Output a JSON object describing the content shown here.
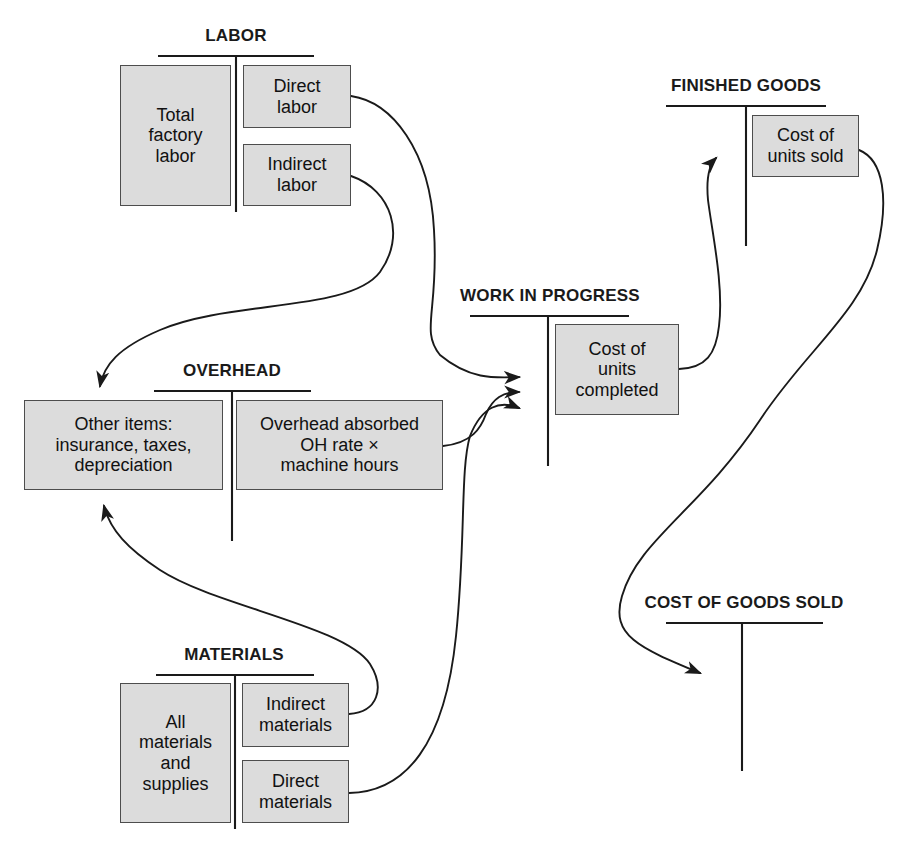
{
  "diagram": {
    "colors": {
      "box_fill": "#dcdcdc",
      "box_border": "#4d4d4d",
      "line": "#1a1a1a",
      "background": "#ffffff",
      "text": "#111111"
    },
    "accounts": [
      {
        "id": "labor",
        "label": "LABOR"
      },
      {
        "id": "overhead",
        "label": "OVERHEAD"
      },
      {
        "id": "materials",
        "label": "MATERIALS"
      },
      {
        "id": "wip",
        "label": "WORK IN PROGRESS"
      },
      {
        "id": "fg",
        "label": "FINISHED GOODS"
      },
      {
        "id": "cogs",
        "label": "COST OF GOODS SOLD"
      }
    ],
    "boxes": [
      {
        "id": "total-factory-labor",
        "account": "labor",
        "side": "debit",
        "text": "Total\nfactory\nlabor"
      },
      {
        "id": "direct-labor",
        "account": "labor",
        "side": "credit",
        "text": "Direct\nlabor"
      },
      {
        "id": "indirect-labor",
        "account": "labor",
        "side": "credit",
        "text": "Indirect\nlabor"
      },
      {
        "id": "other-items",
        "account": "overhead",
        "side": "debit",
        "text": "Other items:\ninsurance, taxes,\ndepreciation"
      },
      {
        "id": "overhead-absorbed",
        "account": "overhead",
        "side": "credit",
        "text": "Overhead absorbed\nOH rate ×\nmachine hours"
      },
      {
        "id": "all-materials",
        "account": "materials",
        "side": "debit",
        "text": "All\nmaterials\nand\nsupplies"
      },
      {
        "id": "indirect-materials",
        "account": "materials",
        "side": "credit",
        "text": "Indirect\nmaterials"
      },
      {
        "id": "direct-materials",
        "account": "materials",
        "side": "credit",
        "text": "Direct\nmaterials"
      },
      {
        "id": "cost-units-completed",
        "account": "wip",
        "side": "credit",
        "text": "Cost of\nunits\ncompleted"
      },
      {
        "id": "cost-units-sold",
        "account": "fg",
        "side": "credit",
        "text": "Cost of\nunits sold"
      }
    ],
    "flows": [
      {
        "id": "direct-labor-to-wip",
        "from": "direct-labor",
        "to": "wip"
      },
      {
        "id": "indirect-labor-to-overhead",
        "from": "indirect-labor",
        "to": "other-items"
      },
      {
        "id": "overhead-absorbed-to-wip",
        "from": "overhead-absorbed",
        "to": "wip"
      },
      {
        "id": "indirect-materials-to-overhead",
        "from": "indirect-materials",
        "to": "other-items"
      },
      {
        "id": "direct-materials-to-wip",
        "from": "direct-materials",
        "to": "wip"
      },
      {
        "id": "units-completed-to-fg",
        "from": "cost-units-completed",
        "to": "fg"
      },
      {
        "id": "units-sold-to-cogs",
        "from": "cost-units-sold",
        "to": "cogs"
      }
    ]
  }
}
